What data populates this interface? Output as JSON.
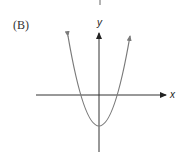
{
  "figure": {
    "panel_label": "(B)",
    "x_axis_label": "x",
    "y_axis_label": "y",
    "curve": {
      "type": "parabola",
      "description": "upward-opening parabola with vertex below the x-axis, arrows at both ends",
      "color": "#7a7a7a"
    },
    "axis_color": "#333333"
  }
}
